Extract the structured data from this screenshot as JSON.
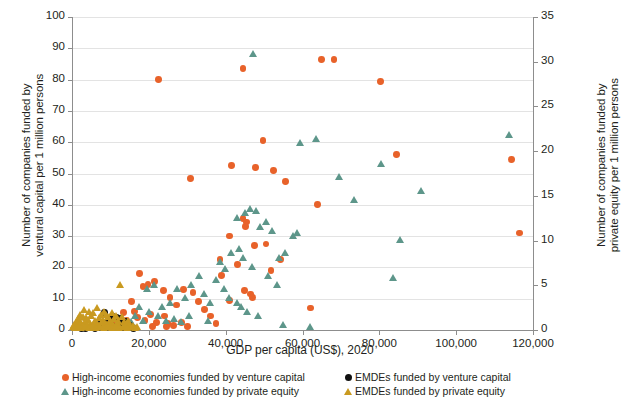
{
  "chart_data": {
    "type": "scatter",
    "title": "",
    "xlabel": "GDP per capita (US$), 2020",
    "ylabel_left": "Number of companies funded by\nventural capital per 1 million persons",
    "ylabel_right": "Number of companies funded by\nprivate equity per 1 million persons",
    "xlim": [
      0,
      120000
    ],
    "ylim_left": [
      0,
      100
    ],
    "ylim_right": [
      0,
      35
    ],
    "xticks": [
      0,
      20000,
      40000,
      60000,
      80000,
      100000,
      120000
    ],
    "xticklabels": [
      "0",
      "20,000",
      "40,000",
      "60,000",
      "80,000",
      "100,000",
      "120,000"
    ],
    "yticks_left": [
      0,
      10,
      20,
      30,
      40,
      50,
      60,
      70,
      80,
      90,
      100
    ],
    "yticklabels_left": [
      "0",
      "10",
      "20",
      "30",
      "40",
      "50",
      "60",
      "70",
      "80",
      "90",
      "100"
    ],
    "yticks_right": [
      0,
      5,
      10,
      15,
      20,
      25,
      30,
      35
    ],
    "yticklabels_right": [
      "0",
      "5",
      "10",
      "15",
      "20",
      "25",
      "30",
      "35"
    ],
    "grid": true,
    "legend_position": "bottom",
    "colors": {
      "high_income_vc": "#e8622a",
      "high_income_pe": "#5d968a",
      "emde_vc": "#111111",
      "emde_pe": "#c99a20"
    },
    "series": [
      {
        "name": "High-income economies funded by venture capital",
        "marker": "circle",
        "color": "#e8622a",
        "axis": "left",
        "points": [
          [
            22600,
            80.0
          ],
          [
            30800,
            48.5
          ],
          [
            44500,
            83.5
          ],
          [
            41500,
            52.5
          ],
          [
            49700,
            60.5
          ],
          [
            47800,
            52.0
          ],
          [
            52500,
            51.0
          ],
          [
            55500,
            47.5
          ],
          [
            65000,
            86.5
          ],
          [
            68200,
            86.5
          ],
          [
            80400,
            79.5
          ],
          [
            84500,
            56.0
          ],
          [
            114500,
            54.5
          ],
          [
            116500,
            31.0
          ],
          [
            64000,
            40.0
          ],
          [
            41000,
            30.0
          ],
          [
            44500,
            35.5
          ],
          [
            45500,
            34.5
          ],
          [
            45200,
            33.0
          ],
          [
            47500,
            27.0
          ],
          [
            50500,
            27.5
          ],
          [
            51800,
            19.0
          ],
          [
            54200,
            22.5
          ],
          [
            38500,
            22.5
          ],
          [
            39000,
            17.5
          ],
          [
            43000,
            21.0
          ],
          [
            44800,
            12.5
          ],
          [
            46500,
            11.5
          ],
          [
            47000,
            10.5
          ],
          [
            41000,
            9.5
          ],
          [
            62000,
            7.0
          ],
          [
            17500,
            18.0
          ],
          [
            18500,
            14.0
          ],
          [
            19800,
            14.5
          ],
          [
            21500,
            15.5
          ],
          [
            23800,
            12.5
          ],
          [
            25500,
            10.5
          ],
          [
            27200,
            8.0
          ],
          [
            29000,
            13.0
          ],
          [
            31500,
            12.0
          ],
          [
            33000,
            9.0
          ],
          [
            34500,
            6.5
          ],
          [
            36000,
            4.5
          ],
          [
            15500,
            9.0
          ],
          [
            16200,
            6.0
          ],
          [
            17000,
            4.0
          ],
          [
            19000,
            3.0
          ],
          [
            20500,
            5.0
          ],
          [
            22000,
            2.5
          ],
          [
            24000,
            4.5
          ],
          [
            25000,
            2.0
          ],
          [
            13500,
            5.5
          ],
          [
            14200,
            3.0
          ],
          [
            12500,
            2.0
          ],
          [
            11000,
            1.5
          ],
          [
            26500,
            1.5
          ],
          [
            28500,
            2.5
          ],
          [
            30000,
            1.0
          ],
          [
            37500,
            2.0
          ],
          [
            24500,
            1.0
          ],
          [
            21000,
            1.2
          ]
        ]
      },
      {
        "name": "High-income economies funded by private equity",
        "marker": "triangle",
        "color": "#5d968a",
        "axis": "right",
        "points": [
          [
            47200,
            30.8
          ],
          [
            113800,
            21.8
          ],
          [
            59500,
            20.8
          ],
          [
            63500,
            21.3
          ],
          [
            91000,
            15.5
          ],
          [
            80500,
            18.5
          ],
          [
            69500,
            17.0
          ],
          [
            73500,
            14.5
          ],
          [
            85500,
            10.0
          ],
          [
            83500,
            5.8
          ],
          [
            43000,
            12.5
          ],
          [
            45000,
            13.0
          ],
          [
            46500,
            13.5
          ],
          [
            48000,
            13.2
          ],
          [
            49000,
            11.5
          ],
          [
            50500,
            12.0
          ],
          [
            52000,
            11.0
          ],
          [
            41500,
            8.5
          ],
          [
            43500,
            9.0
          ],
          [
            38500,
            7.5
          ],
          [
            40000,
            6.8
          ],
          [
            44500,
            8.0
          ],
          [
            47000,
            7.0
          ],
          [
            54000,
            8.0
          ],
          [
            55500,
            8.5
          ],
          [
            57500,
            10.5
          ],
          [
            58500,
            10.8
          ],
          [
            51000,
            6.0
          ],
          [
            53500,
            5.0
          ],
          [
            37500,
            5.5
          ],
          [
            39500,
            4.5
          ],
          [
            41000,
            3.5
          ],
          [
            43000,
            3.0
          ],
          [
            44000,
            2.5
          ],
          [
            45500,
            2.0
          ],
          [
            48500,
            1.5
          ],
          [
            33000,
            6.0
          ],
          [
            34500,
            4.0
          ],
          [
            36000,
            3.0
          ],
          [
            31000,
            5.0
          ],
          [
            29500,
            3.5
          ],
          [
            27500,
            4.5
          ],
          [
            25500,
            3.0
          ],
          [
            23500,
            2.5
          ],
          [
            21500,
            5.0
          ],
          [
            19500,
            4.5
          ],
          [
            17500,
            2.5
          ],
          [
            20000,
            2.0
          ],
          [
            22500,
            1.5
          ],
          [
            24500,
            1.0
          ],
          [
            26500,
            1.2
          ],
          [
            28500,
            0.8
          ],
          [
            30500,
            1.5
          ],
          [
            35500,
            1.0
          ],
          [
            55000,
            0.5
          ],
          [
            62000,
            0.3
          ],
          [
            18500,
            1.0
          ],
          [
            16500,
            1.5
          ],
          [
            15500,
            0.8
          ]
        ]
      },
      {
        "name": "EMDEs funded by venture capital",
        "marker": "circle",
        "color": "#111111",
        "axis": "left",
        "points": [
          [
            8500,
            5.5
          ],
          [
            10500,
            4.5
          ],
          [
            11500,
            4.0
          ],
          [
            12500,
            3.8
          ],
          [
            9500,
            3.0
          ],
          [
            13000,
            2.5
          ],
          [
            7500,
            2.0
          ],
          [
            6500,
            1.5
          ],
          [
            14000,
            2.8
          ],
          [
            15000,
            1.5
          ],
          [
            5500,
            1.0
          ],
          [
            4500,
            0.8
          ],
          [
            10000,
            1.8
          ],
          [
            11000,
            1.2
          ],
          [
            12000,
            1.0
          ],
          [
            8000,
            1.2
          ],
          [
            3500,
            0.6
          ],
          [
            2500,
            0.4
          ],
          [
            13500,
            0.8
          ],
          [
            16000,
            0.6
          ],
          [
            6000,
            0.5
          ],
          [
            7000,
            0.7
          ],
          [
            9000,
            0.9
          ]
        ]
      },
      {
        "name": "EMDEs funded by private equity",
        "marker": "triangle",
        "color": "#c99a20",
        "axis": "right",
        "points": [
          [
            12500,
            5.0
          ],
          [
            3200,
            2.2
          ],
          [
            4500,
            2.0
          ],
          [
            5500,
            1.8
          ],
          [
            6500,
            2.4
          ],
          [
            7500,
            1.6
          ],
          [
            8500,
            2.0
          ],
          [
            9500,
            1.4
          ],
          [
            10500,
            1.8
          ],
          [
            11500,
            1.5
          ],
          [
            2200,
            1.6
          ],
          [
            1500,
            1.2
          ],
          [
            2800,
            1.4
          ],
          [
            3800,
            1.3
          ],
          [
            4200,
            1.1
          ],
          [
            5000,
            1.5
          ],
          [
            6000,
            1.0
          ],
          [
            7000,
            1.3
          ],
          [
            8000,
            1.1
          ],
          [
            9000,
            1.6
          ],
          [
            10000,
            1.0
          ],
          [
            11000,
            1.2
          ],
          [
            12000,
            0.9
          ],
          [
            13000,
            1.4
          ],
          [
            1000,
            0.8
          ],
          [
            1800,
            0.9
          ],
          [
            2500,
            0.7
          ],
          [
            3500,
            0.8
          ],
          [
            4800,
            0.6
          ],
          [
            5800,
            0.7
          ],
          [
            6800,
            0.5
          ],
          [
            7800,
            0.8
          ],
          [
            8800,
            0.6
          ],
          [
            9800,
            0.7
          ],
          [
            10800,
            0.5
          ],
          [
            11800,
            0.6
          ],
          [
            13500,
            0.8
          ],
          [
            14000,
            0.6
          ],
          [
            14500,
            0.9
          ],
          [
            15000,
            0.5
          ],
          [
            600,
            0.5
          ],
          [
            1200,
            0.4
          ],
          [
            2000,
            0.5
          ],
          [
            3000,
            0.4
          ],
          [
            4000,
            0.5
          ],
          [
            5200,
            0.3
          ],
          [
            6200,
            0.4
          ],
          [
            7200,
            0.3
          ],
          [
            8200,
            0.4
          ],
          [
            9200,
            0.3
          ],
          [
            10200,
            0.4
          ],
          [
            11200,
            0.3
          ],
          [
            12200,
            0.4
          ],
          [
            13200,
            0.3
          ],
          [
            14200,
            0.4
          ],
          [
            15500,
            0.3
          ],
          [
            400,
            0.3
          ],
          [
            900,
            0.2
          ],
          [
            1600,
            0.3
          ],
          [
            2400,
            0.2
          ],
          [
            3400,
            0.3
          ],
          [
            4400,
            0.2
          ],
          [
            5400,
            0.3
          ],
          [
            6400,
            0.2
          ],
          [
            7400,
            0.3
          ],
          [
            8400,
            0.2
          ],
          [
            9400,
            0.3
          ],
          [
            10400,
            0.2
          ],
          [
            11400,
            0.3
          ],
          [
            12400,
            0.2
          ],
          [
            13400,
            0.3
          ],
          [
            14400,
            0.2
          ],
          [
            16000,
            0.4
          ],
          [
            16500,
            0.2
          ],
          [
            17000,
            0.3
          ]
        ]
      }
    ]
  },
  "legend": {
    "items": [
      {
        "label": "High-income economies funded by venture capital",
        "marker": "circle",
        "color": "#e8622a"
      },
      {
        "label": "EMDEs funded by venture capital",
        "marker": "circle",
        "color": "#111111"
      },
      {
        "label": "High-income economies funded by private equity",
        "marker": "triangle",
        "color": "#5d968a"
      },
      {
        "label": "EMDEs funded by private equity",
        "marker": "triangle",
        "color": "#c99a20"
      }
    ]
  }
}
